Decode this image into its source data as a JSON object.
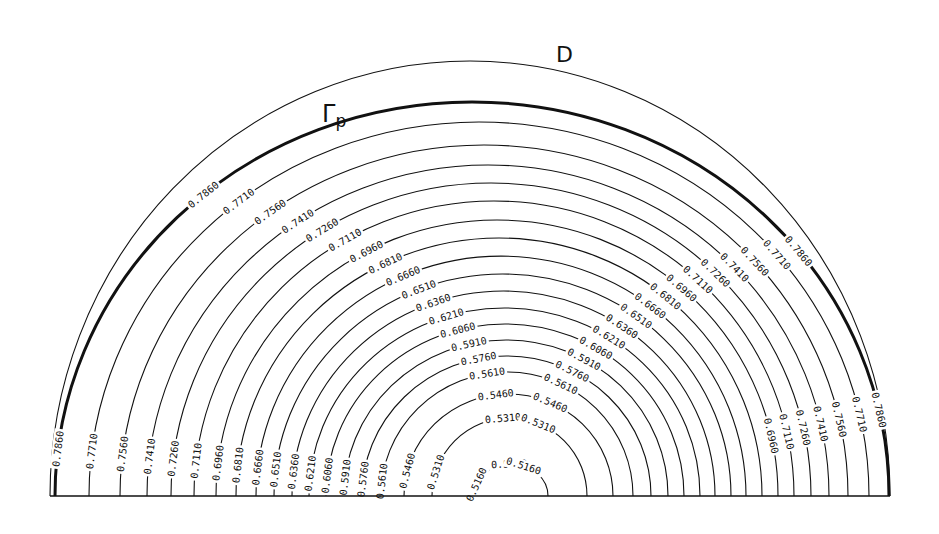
{
  "figure": {
    "domain_label": "D",
    "boundary_label": "Γ",
    "boundary_label_sub": "p",
    "line_color": "#111111",
    "background": "#ffffff"
  },
  "geometry": {
    "base_y": 496,
    "base_x_left": 50,
    "base_x_right": 890,
    "outer_domain": {
      "x_left": 50,
      "x_right": 890,
      "apex_y": 61
    }
  },
  "chart_data": {
    "type": "contour",
    "title": "",
    "levels": [
      0.516,
      0.531,
      0.546,
      0.561,
      0.576,
      0.591,
      0.606,
      0.621,
      0.636,
      0.651,
      0.666,
      0.681,
      0.696,
      0.711,
      0.726,
      0.741,
      0.756,
      0.771,
      0.786
    ],
    "level_step": 0.015,
    "contours": [
      {
        "label": "0.5160",
        "x_left": 474,
        "x_right": 548,
        "apex_y": 464
      },
      {
        "label": "0.5310",
        "x_left": 432,
        "x_right": 587,
        "apex_y": 418
      },
      {
        "label": "0.5460",
        "x_left": 404,
        "x_right": 613,
        "apex_y": 394
      },
      {
        "label": "0.5610",
        "x_left": 381,
        "x_right": 633,
        "apex_y": 372
      },
      {
        "label": "0.5760",
        "x_left": 362,
        "x_right": 651,
        "apex_y": 356
      },
      {
        "label": "0.5910",
        "x_left": 344,
        "x_right": 668,
        "apex_y": 340
      },
      {
        "label": "0.6060",
        "x_left": 326,
        "x_right": 684,
        "apex_y": 324
      },
      {
        "label": "0.6210",
        "x_left": 309,
        "x_right": 700,
        "apex_y": 308
      },
      {
        "label": "0.6360",
        "x_left": 292,
        "x_right": 715,
        "apex_y": 291
      },
      {
        "label": "0.6510",
        "x_left": 274,
        "x_right": 731,
        "apex_y": 274
      },
      {
        "label": "0.6660",
        "x_left": 256,
        "x_right": 746,
        "apex_y": 256
      },
      {
        "label": "0.6810",
        "x_left": 236,
        "x_right": 762,
        "apex_y": 238
      },
      {
        "label": "0.6960",
        "x_left": 216,
        "x_right": 778,
        "apex_y": 220
      },
      {
        "label": "0.7110",
        "x_left": 194,
        "x_right": 794,
        "apex_y": 201
      },
      {
        "label": "0.7260",
        "x_left": 171,
        "x_right": 811,
        "apex_y": 183
      },
      {
        "label": "0.7410",
        "x_left": 147,
        "x_right": 829,
        "apex_y": 165
      },
      {
        "label": "0.7560",
        "x_left": 120,
        "x_right": 848,
        "apex_y": 145
      },
      {
        "label": "0.7710",
        "x_left": 89,
        "x_right": 869,
        "apex_y": 122
      },
      {
        "label": "0.7860",
        "x_left": 55,
        "x_right": 889,
        "apex_y": 102,
        "bold": true
      }
    ],
    "annotations": [
      "D",
      "Γp"
    ],
    "xlabel": "",
    "ylabel": "",
    "grid": false,
    "legend": null
  }
}
